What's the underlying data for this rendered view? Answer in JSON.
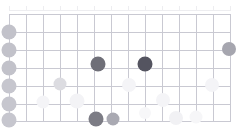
{
  "chart_data": {
    "type": "scatter",
    "title": "",
    "subtitle": "",
    "xlabel": "",
    "ylabel": "",
    "grid": true,
    "legend": false,
    "grid_origin_px": {
      "x": 9,
      "y": 14
    },
    "grid_size_px": {
      "width": 222,
      "height": 107
    },
    "axis_ranges": {
      "xlim": [
        0,
        13
      ],
      "ylim": [
        0,
        6
      ]
    },
    "grid_columns": 13,
    "grid_rows": 6,
    "x_gridline_px": [
      9,
      26,
      43,
      60,
      77,
      94,
      111,
      128,
      145,
      162,
      179,
      196,
      213,
      230
    ],
    "y_gridline_px": [
      14,
      32,
      50,
      68,
      86,
      104,
      121
    ],
    "top_axis": {
      "line_y_px": 10,
      "start_x_px": 9,
      "end_x_px": 231,
      "tick_x_px": [
        9,
        26,
        43,
        60,
        77,
        94,
        111,
        128,
        145,
        162,
        179,
        196,
        213,
        230
      ],
      "tick_labels": [
        "",
        "",
        "",
        "",
        "",
        "",
        "",
        "",
        "",
        "",
        "",
        "",
        "",
        ""
      ],
      "label_color": "#f2f2f4",
      "line_color": "#ededf0"
    },
    "colors": {
      "background": "#ffffff",
      "gridline": "#c9c9d2",
      "bubble_dark": "#6e6e76",
      "bubble_mid": "#a8a8b0",
      "bubble_light": "#d9d9de",
      "bubble_faint": "#f0f0f3",
      "bubble_ghost": "#f7f7f9"
    },
    "points": [
      {
        "label": "row-1-axis",
        "cx": 9,
        "cy": 32,
        "r": 7.5,
        "color": "#c2c2ca",
        "intensity": 0.3
      },
      {
        "label": "row-2-axis",
        "cx": 9,
        "cy": 50,
        "r": 7.5,
        "color": "#c2c2ca",
        "intensity": 0.3
      },
      {
        "label": "row-3-axis",
        "cx": 9,
        "cy": 68,
        "r": 7.5,
        "color": "#c2c2ca",
        "intensity": 0.3
      },
      {
        "label": "row-4-axis",
        "cx": 9,
        "cy": 86,
        "r": 7.5,
        "color": "#c6c6ce",
        "intensity": 0.28
      },
      {
        "label": "row-5-axis",
        "cx": 9,
        "cy": 104,
        "r": 7.5,
        "color": "#c6c6ce",
        "intensity": 0.28
      },
      {
        "label": "row-6-axis",
        "cx": 9,
        "cy": 120,
        "r": 7.5,
        "color": "#c6c6ce",
        "intensity": 0.28
      },
      {
        "label": "dark-a",
        "cx": 98,
        "cy": 64,
        "r": 7.5,
        "color": "#6f6f78",
        "intensity": 0.92
      },
      {
        "label": "dark-b",
        "cx": 145,
        "cy": 64,
        "r": 7.5,
        "color": "#545460",
        "intensity": 1.0
      },
      {
        "label": "right-edge",
        "cx": 229,
        "cy": 49,
        "r": 7.0,
        "color": "#a6a6af",
        "intensity": 0.55
      },
      {
        "label": "mid-left",
        "cx": 60,
        "cy": 84,
        "r": 6.5,
        "color": "#dcdce1",
        "intensity": 0.18
      },
      {
        "label": "bottom-dark",
        "cx": 96,
        "cy": 119,
        "r": 7.5,
        "color": "#7c7c85",
        "intensity": 0.85
      },
      {
        "label": "bottom-mid",
        "cx": 113,
        "cy": 119,
        "r": 6.5,
        "color": "#a9a9b2",
        "intensity": 0.52
      },
      {
        "label": "ghost-1",
        "cx": 43,
        "cy": 102,
        "r": 6.5,
        "color": "#f4f4f7",
        "intensity": 0.05
      },
      {
        "label": "ghost-2",
        "cx": 77,
        "cy": 101,
        "r": 7.5,
        "color": "#f3f3f6",
        "intensity": 0.06
      },
      {
        "label": "ghost-3",
        "cx": 129,
        "cy": 85,
        "r": 7.0,
        "color": "#f4f4f7",
        "intensity": 0.05
      },
      {
        "label": "ghost-4",
        "cx": 163,
        "cy": 100,
        "r": 7.0,
        "color": "#f4f4f7",
        "intensity": 0.05
      },
      {
        "label": "ghost-5",
        "cx": 212,
        "cy": 85,
        "r": 7.0,
        "color": "#f4f4f7",
        "intensity": 0.05
      },
      {
        "label": "ghost-6",
        "cx": 176,
        "cy": 118,
        "r": 7.0,
        "color": "#f1f1f4",
        "intensity": 0.07
      },
      {
        "label": "ghost-7",
        "cx": 196,
        "cy": 117,
        "r": 6.5,
        "color": "#f6f6f8",
        "intensity": 0.04
      },
      {
        "label": "ghost-8",
        "cx": 145,
        "cy": 113,
        "r": 6.0,
        "color": "#f7f7f9",
        "intensity": 0.03
      }
    ]
  }
}
